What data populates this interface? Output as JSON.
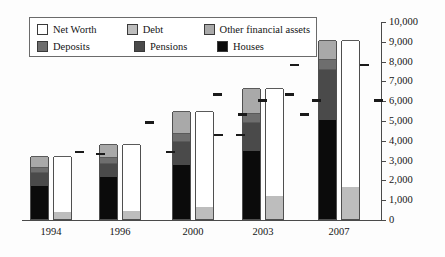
{
  "legend": {
    "items": [
      {
        "label": "Net Worth",
        "key": "networth",
        "color": "#ffffff"
      },
      {
        "label": "Debt",
        "key": "debt",
        "color": "#bdbdbd"
      },
      {
        "label": "Other financial assets",
        "key": "other",
        "color": "#a9a9a9"
      },
      {
        "label": "Deposits",
        "key": "deposits",
        "color": "#6e6e6e"
      },
      {
        "label": "Pensions",
        "key": "pensions",
        "color": "#4a4a4a"
      },
      {
        "label": "Houses",
        "key": "houses",
        "color": "#0b0b0b"
      }
    ]
  },
  "axis": {
    "y_ticks": [
      "0",
      "1,000",
      "2,000",
      "3,000",
      "4,000",
      "5,000",
      "6,000",
      "7,000",
      "8,000",
      "9,000",
      "10,000"
    ],
    "y_min": 0,
    "y_max": 10000,
    "y_step": 1000,
    "y_position": "right",
    "x_labels": [
      "1994",
      "1996",
      "2000",
      "2003",
      "2007"
    ]
  },
  "chart_data": {
    "type": "bar",
    "title": "",
    "subtitle": "",
    "xlabel": "",
    "ylabel": "",
    "ylim": [
      0,
      10000
    ],
    "ytick_step": 1000,
    "grid": false,
    "legend_position": "top-left",
    "stacked": true,
    "grouped": true,
    "categories": [
      "1994",
      "1996",
      "2000",
      "2003",
      "2007"
    ],
    "series": [
      {
        "name": "Houses",
        "stack": "assets",
        "values": [
          1650,
          2100,
          2750,
          3450,
          5000
        ]
      },
      {
        "name": "Pensions",
        "stack": "assets",
        "values": [
          700,
          750,
          1200,
          1450,
          2600
        ]
      },
      {
        "name": "Deposits",
        "stack": "assets",
        "values": [
          300,
          300,
          400,
          450,
          500
        ]
      },
      {
        "name": "Other financial assets",
        "stack": "assets",
        "values": [
          550,
          650,
          1100,
          1250,
          950
        ]
      },
      {
        "name": "Debt",
        "stack": "liabilities",
        "values": [
          350,
          400,
          600,
          1150,
          1600
        ]
      },
      {
        "name": "Net Worth",
        "stack": "liabilities",
        "values": [
          2850,
          3400,
          4850,
          5450,
          7450
        ]
      }
    ],
    "markers": {
      "name": "reference marks",
      "description": "short horizontal dashes placed beside each year group",
      "values": [
        {
          "category": "1994",
          "levels": [
            3400
          ]
        },
        {
          "category": "1996",
          "levels": [
            3500,
            3500
          ]
        },
        {
          "category": "2000",
          "levels": [
            5000,
            4350,
            4350
          ]
        },
        {
          "category": "2003",
          "levels": [
            6400,
            6400,
            5400,
            5400
          ]
        },
        {
          "category": "2007",
          "levels": [
            7900,
            7900,
            6100,
            6100,
            6100
          ]
        }
      ]
    }
  }
}
